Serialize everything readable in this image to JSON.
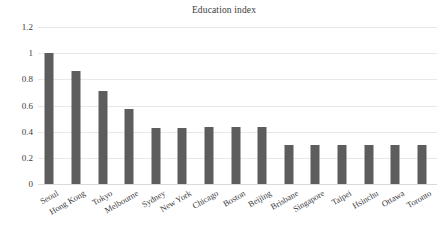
{
  "chart_data": {
    "type": "bar",
    "title": "Education index",
    "xlabel": "",
    "ylabel": "",
    "categories": [
      "Seoul",
      "Hong Kong",
      "Tokyo",
      "Melbourne",
      "Sydney",
      "New York",
      "Chicago",
      "Boston",
      "Beijing",
      "Brisbane",
      "Singapore",
      "Taipei",
      "Hsinchu",
      "Ottawa",
      "Toronto"
    ],
    "values": [
      1.0,
      0.86,
      0.71,
      0.575,
      0.43,
      0.43,
      0.435,
      0.435,
      0.435,
      0.295,
      0.295,
      0.295,
      0.295,
      0.295,
      0.3
    ],
    "ylim": [
      0,
      1.2
    ],
    "yticks": [
      0,
      0.2,
      0.4,
      0.6,
      0.8,
      1.0,
      1.2
    ],
    "ytick_labels": [
      "0",
      "0.2",
      "0.4",
      "0.6",
      "0.8",
      "1",
      "1.2"
    ],
    "grid": true,
    "legend": false,
    "bar_color": "#5d5d5d",
    "gridline_color": "#e8e8e8",
    "background_color": "#ffffff"
  }
}
